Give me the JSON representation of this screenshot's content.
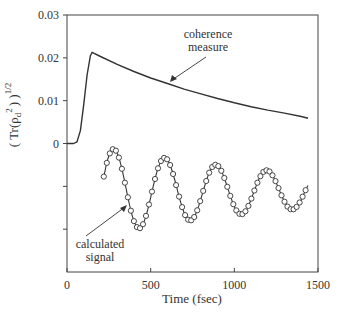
{
  "chart_data": {
    "type": "line",
    "title": "",
    "xlabel": "Time (fsec)",
    "ylabel": "( Tr(ρ_d²) )^1/2",
    "ylabel_parts": {
      "open": "( Tr(ρ",
      "sub": "d",
      "sup2": "2",
      "close": ") )",
      "exp": "1/2"
    },
    "xlim": [
      0,
      1500
    ],
    "ylim": [
      -0.03,
      0.03
    ],
    "grid": false,
    "legend": "none",
    "x_ticks": [
      0,
      500,
      1000,
      1500
    ],
    "x_tick_labels": [
      "0",
      "500",
      "1000",
      "1500"
    ],
    "y_ticks": [
      0.03,
      0.02,
      0.01,
      0,
      -0.01,
      -0.02
    ],
    "y_tick_labels": [
      "0.03",
      "0.02",
      "0.01",
      "0",
      "",
      ""
    ],
    "series": [
      {
        "name": "coherence measure",
        "style": "solid line",
        "x": [
          0,
          40,
          60,
          80,
          100,
          120,
          140,
          150,
          200,
          300,
          400,
          500,
          600,
          700,
          800,
          900,
          1000,
          1100,
          1200,
          1300,
          1400,
          1440
        ],
        "y": [
          0,
          0,
          0.0004,
          0.003,
          0.009,
          0.016,
          0.0205,
          0.0213,
          0.0203,
          0.0185,
          0.0168,
          0.0153,
          0.014,
          0.0127,
          0.0116,
          0.0105,
          0.0095,
          0.0086,
          0.0078,
          0.0071,
          0.0063,
          0.0059
        ]
      },
      {
        "name": "calculated signal",
        "style": "solid line with open circle markers",
        "note": "arbitrary units, offset below zero; damped oscillation, period ≈ 305 fs",
        "x": [
          220,
          280,
          430,
          585,
          735,
          890,
          1035,
          1190,
          1340,
          1440
        ],
        "y": [
          -0.0086,
          -0.002,
          -0.0201,
          -0.0044,
          -0.0173,
          -0.0065,
          -0.0159,
          -0.0075,
          -0.0146,
          -0.0096
        ],
        "model": {
          "center": -0.0111,
          "amp0": 0.0098,
          "decay_fs": 1300,
          "period_fs": 305,
          "phase_t0": 280,
          "t_start": 220,
          "t_end": 1440,
          "marker_step_fs": 18
        }
      }
    ],
    "annotations": [
      {
        "text_lines": [
          "coherence",
          "measure"
        ],
        "arrow_to_x": 520,
        "arrow_to_y": 0.015
      },
      {
        "text_lines": [
          "calculated",
          "signal"
        ],
        "arrow_to_x": 340,
        "arrow_to_y": -0.0145
      }
    ]
  }
}
